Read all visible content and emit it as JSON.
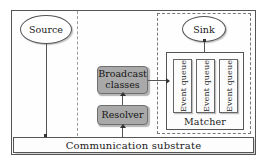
{
  "diagram": {
    "nodes": {
      "source": "Source",
      "sink": "Sink",
      "broadcast_classes": "Broadcast classes",
      "resolver": "Resolver",
      "matcher": "Matcher",
      "substrate": "Communication substrate"
    },
    "event_queues": [
      {
        "label": "Event queue"
      },
      {
        "label": "Event queue"
      },
      {
        "label": "Event queue"
      }
    ],
    "colors": {
      "gray_box_fill": "#a9a9a9",
      "gray_box_border": "#6e6e6e",
      "frame_border": "#555555",
      "dashed_border": "#777777",
      "background": "#ffffff"
    }
  }
}
